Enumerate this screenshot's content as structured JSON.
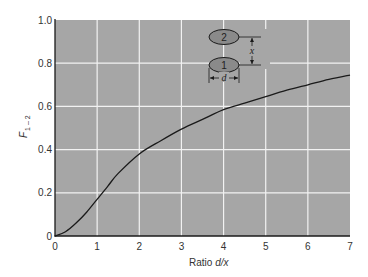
{
  "chart_data": {
    "type": "line",
    "title": "",
    "xlabel": "Ratio d/x",
    "xlabel_prefix": "Ratio ",
    "xlabel_var": "d/x",
    "ylabel": "F1–2",
    "ylabel_main": "F",
    "ylabel_sub": "1 – 2",
    "xlim": [
      0,
      7
    ],
    "ylim": [
      0,
      1.0
    ],
    "x_ticks": [
      "0",
      "1",
      "2",
      "3",
      "4",
      "5",
      "6",
      "7"
    ],
    "y_ticks": [
      "0",
      "0.2",
      "0.4",
      "0.6",
      "0.8",
      "1.0"
    ],
    "grid": true,
    "legend": null,
    "series": [
      {
        "name": "F1-2 vs d/x",
        "x": [
          0,
          0.25,
          0.5,
          0.75,
          1.0,
          1.25,
          1.5,
          2.0,
          2.5,
          3.0,
          3.5,
          4.0,
          4.5,
          5.0,
          5.5,
          6.0,
          6.5,
          7.0
        ],
        "y": [
          0,
          0.02,
          0.06,
          0.11,
          0.17,
          0.23,
          0.29,
          0.38,
          0.44,
          0.495,
          0.54,
          0.585,
          0.615,
          0.645,
          0.675,
          0.7,
          0.725,
          0.745
        ]
      }
    ],
    "inset": {
      "description": "Two parallel coaxial disks",
      "disk_top_label": "2",
      "disk_bottom_label": "1",
      "separation_label": "x",
      "diameter_label": "d"
    },
    "colors": {
      "plot_background": "#a6a6a6",
      "grid": "#f2f2f2",
      "curve": "#1a1a1a",
      "axis": "#1a1a1a"
    }
  }
}
